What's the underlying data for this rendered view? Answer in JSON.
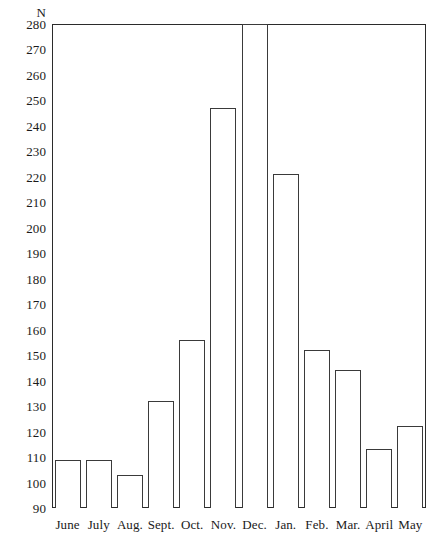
{
  "chart_data": {
    "type": "bar",
    "title": "",
    "subtitle": "",
    "xlabel": "",
    "ylabel": "N",
    "ylim": [
      90,
      280
    ],
    "ytick_step": 10,
    "yticks": [
      280,
      270,
      260,
      250,
      240,
      230,
      220,
      210,
      200,
      190,
      180,
      170,
      160,
      150,
      140,
      130,
      120,
      110,
      100,
      90
    ],
    "categories": [
      "June",
      "July",
      "Aug.",
      "Sept.",
      "Oct.",
      "Nov.",
      "Dec.",
      "Jan.",
      "Feb.",
      "Mar.",
      "April",
      "May"
    ],
    "values": [
      109,
      109,
      103,
      132,
      156,
      247,
      280,
      221,
      152,
      144,
      113,
      122
    ],
    "grid": false,
    "legend": null,
    "annotations": [],
    "bar_style": {
      "fill": "#ffffff",
      "stroke": "#3a3a3a"
    }
  },
  "axis": {
    "unit_label": "N"
  }
}
